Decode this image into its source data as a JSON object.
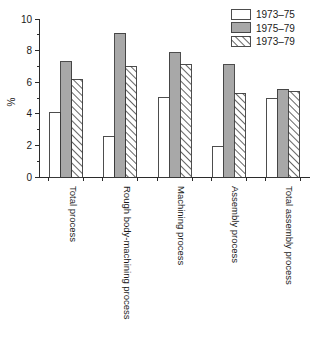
{
  "chart_data": {
    "type": "bar",
    "title": "",
    "xlabel": "",
    "ylabel": "%",
    "ylim": [
      0,
      10
    ],
    "yticks": [
      0,
      2,
      4,
      6,
      8,
      10
    ],
    "yticklabels": [
      "0",
      "2",
      "4",
      "6",
      "8",
      "10"
    ],
    "minor_tick_step": 1,
    "grid": false,
    "legend_position": "top-right",
    "categories": [
      "Total process",
      "Rough body-machining process",
      "Machining process",
      "Assembly process",
      "Total assembly process"
    ],
    "series": [
      {
        "name": "1973–75",
        "fill": "#ffffff",
        "pattern": "solid",
        "values": [
          4.1,
          2.55,
          5.05,
          1.9,
          5.0
        ]
      },
      {
        "name": "1975–79",
        "fill": "#a8a8a8",
        "pattern": "solid",
        "values": [
          7.3,
          9.1,
          7.85,
          7.1,
          5.55
        ]
      },
      {
        "name": "1973–79",
        "fill": "#ffffff",
        "pattern": "diagonal-hatch",
        "values": [
          6.2,
          7.0,
          7.1,
          5.3,
          5.4
        ]
      }
    ]
  },
  "legend": {
    "items": [
      {
        "label": "1973–75"
      },
      {
        "label": "1975–79"
      },
      {
        "label": "1973–79"
      }
    ]
  },
  "axis": {
    "y_title": "%"
  },
  "colors": {
    "series_white": "#ffffff",
    "series_gray": "#a8a8a8",
    "outline": "#3a3a3a",
    "axis": "#2b2b2b",
    "text": "#1a1a1a"
  }
}
